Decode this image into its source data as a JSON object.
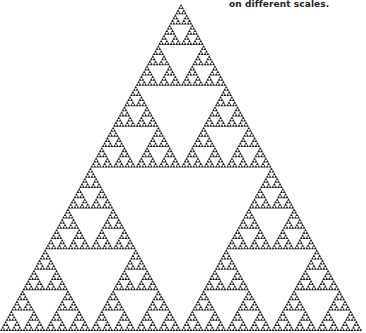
{
  "caption": {
    "text": "on different scales."
  },
  "fractal": {
    "type": "sierpinski-triangle",
    "depth": 7,
    "apex": [
      181,
      4
    ],
    "base_left": [
      0,
      331
    ],
    "base_right": [
      362,
      331
    ],
    "fill_color": "#1a1a1a",
    "background_color": "#ffffff"
  }
}
